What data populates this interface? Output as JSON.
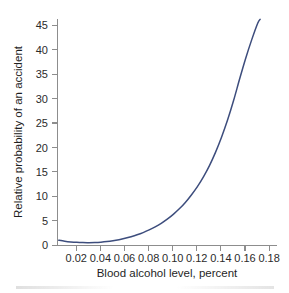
{
  "chart_data": {
    "type": "line",
    "title": "",
    "xlabel": "Blood alcohol level, percent",
    "ylabel": "Relative probability of an accident",
    "xlim": [
      0.004,
      0.186
    ],
    "ylim": [
      0,
      47
    ],
    "xticks": [
      0.02,
      0.04,
      0.06,
      0.08,
      0.1,
      0.12,
      0.14,
      0.16,
      0.18
    ],
    "xtick_labels": [
      "0.02",
      "0.04",
      "0.06",
      "0.08",
      "0.10",
      "0.12",
      "0.14",
      "0.16",
      "0.18"
    ],
    "yticks": [
      0,
      5,
      10,
      15,
      20,
      25,
      30,
      35,
      40,
      45
    ],
    "ytick_labels": [
      "0",
      "5",
      "10",
      "15",
      "20",
      "25",
      "30",
      "35",
      "40",
      "45"
    ],
    "grid": false,
    "legend": null,
    "series": [
      {
        "name": "Relative probability of an accident",
        "color": "#3d4d7d",
        "x": [
          0.005,
          0.01,
          0.015,
          0.02,
          0.025,
          0.03,
          0.035,
          0.04,
          0.045,
          0.05,
          0.055,
          0.06,
          0.065,
          0.07,
          0.075,
          0.08,
          0.085,
          0.09,
          0.095,
          0.1,
          0.105,
          0.11,
          0.115,
          0.12,
          0.125,
          0.13,
          0.135,
          0.14,
          0.145,
          0.15,
          0.155,
          0.16,
          0.165,
          0.17,
          0.172
        ],
        "y": [
          1.05,
          0.85,
          0.7,
          0.6,
          0.55,
          0.54,
          0.57,
          0.64,
          0.76,
          0.93,
          1.15,
          1.42,
          1.75,
          2.14,
          2.6,
          3.14,
          3.77,
          4.5,
          5.35,
          6.33,
          7.46,
          8.77,
          10.3,
          12.0,
          14.0,
          16.3,
          19.0,
          22.1,
          25.6,
          29.6,
          34.0,
          38.2,
          42.0,
          45.4,
          46.2
        ]
      }
    ]
  },
  "axis": {
    "line_color": "#8d8d8d",
    "tick_color": "#8d8d8d",
    "label_color": "#2b2b2b"
  },
  "background": {
    "color": "#ffffff"
  }
}
